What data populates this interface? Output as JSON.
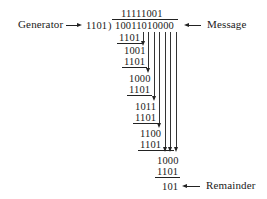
{
  "labels": {
    "generator": "Generator",
    "message": "Message",
    "remainder": "Remainder"
  },
  "division": {
    "divisor": "1101",
    "bracket": ")",
    "quotient": "11111001",
    "dividend": "10011010000",
    "steps": [
      {
        "value": "1101",
        "type": "subtract"
      },
      {
        "value": "1001",
        "type": "partial"
      },
      {
        "value": "1101",
        "type": "subtract"
      },
      {
        "value": "1000",
        "type": "partial"
      },
      {
        "value": "1101",
        "type": "subtract"
      },
      {
        "value": "1011",
        "type": "partial"
      },
      {
        "value": "1101",
        "type": "subtract"
      },
      {
        "value": "1100",
        "type": "partial"
      },
      {
        "value": "1101",
        "type": "subtract"
      },
      {
        "value": "1000",
        "type": "partial"
      },
      {
        "value": "1101",
        "type": "subtract"
      }
    ],
    "remainder": "101"
  }
}
